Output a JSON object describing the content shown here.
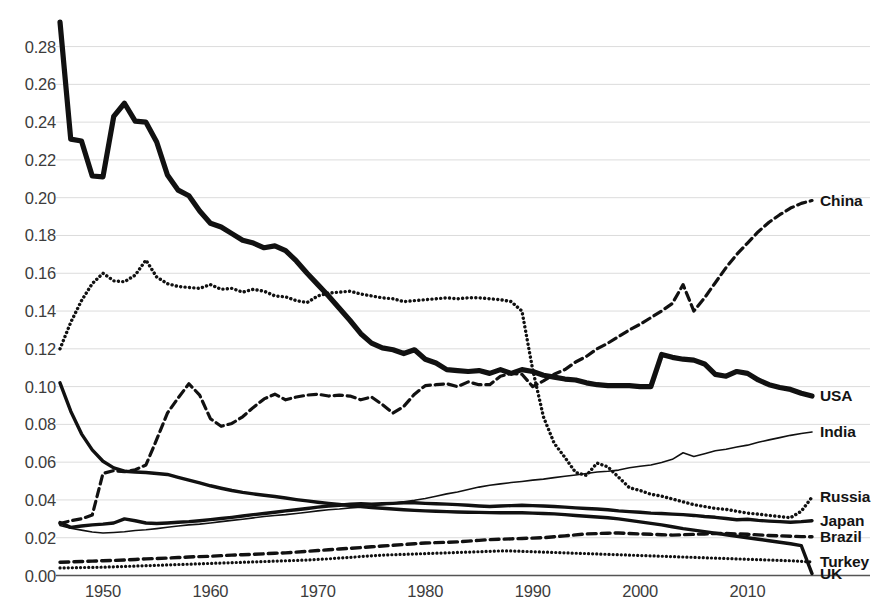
{
  "chart_data": {
    "type": "line",
    "title": "",
    "xlabel": "",
    "ylabel": "",
    "xlim": [
      1946,
      2016
    ],
    "ylim": [
      0.0,
      0.295
    ],
    "grid": true,
    "legend_position": "right-inline-labels",
    "y_ticks": [
      "0.00",
      "0.02",
      "0.04",
      "0.06",
      "0.08",
      "0.10",
      "0.12",
      "0.14",
      "0.16",
      "0.18",
      "0.20",
      "0.22",
      "0.24",
      "0.26",
      "0.28"
    ],
    "y_tick_values": [
      0.0,
      0.02,
      0.04,
      0.06,
      0.08,
      0.1,
      0.12,
      0.14,
      0.16,
      0.18,
      0.2,
      0.22,
      0.24,
      0.26,
      0.28
    ],
    "x_ticks": [
      "1950",
      "1960",
      "1970",
      "1980",
      "1990",
      "2000",
      "2010"
    ],
    "x_tick_values": [
      1950,
      1960,
      1970,
      1980,
      1990,
      2000,
      2010
    ],
    "x": [
      1946,
      1947,
      1948,
      1949,
      1950,
      1951,
      1952,
      1953,
      1954,
      1955,
      1956,
      1957,
      1958,
      1959,
      1960,
      1961,
      1962,
      1963,
      1964,
      1965,
      1966,
      1967,
      1968,
      1969,
      1970,
      1971,
      1972,
      1973,
      1974,
      1975,
      1976,
      1977,
      1978,
      1979,
      1980,
      1981,
      1982,
      1983,
      1984,
      1985,
      1986,
      1987,
      1988,
      1989,
      1990,
      1991,
      1992,
      1993,
      1994,
      1995,
      1996,
      1997,
      1998,
      1999,
      2000,
      2001,
      2002,
      2003,
      2004,
      2005,
      2006,
      2007,
      2008,
      2009,
      2010,
      2011,
      2012,
      2013,
      2014,
      2015,
      2016
    ],
    "series": [
      {
        "name": "China",
        "style": "dashed",
        "width": 3.2,
        "label_y": 0.1985,
        "values": [
          0.0275,
          0.029,
          0.03,
          0.032,
          0.054,
          0.0555,
          0.055,
          0.056,
          0.0585,
          0.072,
          0.086,
          0.094,
          0.1015,
          0.0955,
          0.083,
          0.079,
          0.0805,
          0.084,
          0.089,
          0.0935,
          0.096,
          0.093,
          0.0945,
          0.0955,
          0.096,
          0.095,
          0.0955,
          0.095,
          0.093,
          0.0945,
          0.0905,
          0.086,
          0.0895,
          0.096,
          0.1005,
          0.101,
          0.1015,
          0.1,
          0.1025,
          0.101,
          0.101,
          0.1055,
          0.107,
          0.1065,
          0.1,
          0.103,
          0.1065,
          0.109,
          0.113,
          0.116,
          0.12,
          0.123,
          0.1265,
          0.13,
          0.133,
          0.1365,
          0.14,
          0.144,
          0.154,
          0.14,
          0.147,
          0.155,
          0.163,
          0.17,
          0.176,
          0.182,
          0.187,
          0.191,
          0.1945,
          0.197,
          0.1985
        ]
      },
      {
        "name": "USA",
        "style": "solid",
        "width": 5.2,
        "label_y": 0.095,
        "values": [
          0.293,
          0.231,
          0.23,
          0.2115,
          0.211,
          0.243,
          0.25,
          0.2405,
          0.24,
          0.2295,
          0.212,
          0.204,
          0.201,
          0.193,
          0.1865,
          0.1845,
          0.181,
          0.1775,
          0.176,
          0.1735,
          0.1745,
          0.172,
          0.1665,
          0.16,
          0.154,
          0.148,
          0.1415,
          0.135,
          0.128,
          0.123,
          0.1205,
          0.1195,
          0.1175,
          0.1195,
          0.1145,
          0.1125,
          0.109,
          0.1085,
          0.108,
          0.1085,
          0.107,
          0.109,
          0.107,
          0.109,
          0.108,
          0.106,
          0.105,
          0.104,
          0.1035,
          0.102,
          0.101,
          0.1005,
          0.1005,
          0.1005,
          0.1,
          0.1,
          0.117,
          0.1155,
          0.1145,
          0.114,
          0.112,
          0.1065,
          0.1055,
          0.108,
          0.107,
          0.1035,
          0.101,
          0.0995,
          0.0985,
          0.0965,
          0.095
        ]
      },
      {
        "name": "India",
        "style": "solid",
        "width": 1.6,
        "label_y": 0.076,
        "values": [
          0.0265,
          0.025,
          0.024,
          0.023,
          0.0225,
          0.0228,
          0.0232,
          0.0238,
          0.0242,
          0.0248,
          0.0255,
          0.0262,
          0.0268,
          0.0272,
          0.0278,
          0.0285,
          0.0292,
          0.0298,
          0.0305,
          0.0312,
          0.0318,
          0.0322,
          0.0328,
          0.0335,
          0.0342,
          0.0348,
          0.0352,
          0.0358,
          0.0362,
          0.0368,
          0.0375,
          0.0382,
          0.039,
          0.0398,
          0.0408,
          0.042,
          0.0432,
          0.0442,
          0.0455,
          0.0468,
          0.0478,
          0.0485,
          0.0492,
          0.0498,
          0.0505,
          0.051,
          0.0518,
          0.0525,
          0.0532,
          0.054,
          0.0548,
          0.0552,
          0.0558,
          0.057,
          0.0578,
          0.0585,
          0.0598,
          0.0615,
          0.065,
          0.063,
          0.0645,
          0.066,
          0.0668,
          0.068,
          0.069,
          0.0705,
          0.0718,
          0.073,
          0.0742,
          0.0752,
          0.076
        ]
      },
      {
        "name": "Russia",
        "style": "dotted",
        "width": 3.4,
        "label_y": 0.0415,
        "values": [
          0.12,
          0.134,
          0.1455,
          0.1545,
          0.16,
          0.156,
          0.1555,
          0.159,
          0.167,
          0.158,
          0.1545,
          0.153,
          0.1525,
          0.152,
          0.154,
          0.1515,
          0.152,
          0.15,
          0.1515,
          0.1505,
          0.148,
          0.1475,
          0.1455,
          0.1445,
          0.148,
          0.1495,
          0.15,
          0.1505,
          0.149,
          0.148,
          0.147,
          0.1465,
          0.145,
          0.1455,
          0.146,
          0.1465,
          0.147,
          0.1465,
          0.147,
          0.147,
          0.1465,
          0.146,
          0.145,
          0.14,
          0.109,
          0.084,
          0.07,
          0.0625,
          0.0545,
          0.053,
          0.0595,
          0.0575,
          0.052,
          0.0465,
          0.045,
          0.043,
          0.042,
          0.0405,
          0.039,
          0.0375,
          0.0365,
          0.0355,
          0.035,
          0.034,
          0.033,
          0.0325,
          0.0318,
          0.0312,
          0.0306,
          0.034,
          0.0415
        ]
      },
      {
        "name": "Japan",
        "style": "solid",
        "width": 3.4,
        "label_y": 0.029,
        "values": [
          0.028,
          0.0255,
          0.0262,
          0.0268,
          0.0272,
          0.0278,
          0.03,
          0.029,
          0.0278,
          0.0275,
          0.0278,
          0.0282,
          0.0285,
          0.029,
          0.0296,
          0.0302,
          0.0308,
          0.0315,
          0.0322,
          0.0328,
          0.0335,
          0.0342,
          0.0348,
          0.0355,
          0.0362,
          0.0368,
          0.0372,
          0.0378,
          0.038,
          0.0378,
          0.038,
          0.0382,
          0.0385,
          0.0385,
          0.0382,
          0.038,
          0.0378,
          0.0375,
          0.0372,
          0.0368,
          0.0365,
          0.0368,
          0.037,
          0.0372,
          0.037,
          0.0368,
          0.0365,
          0.0362,
          0.0358,
          0.0355,
          0.0352,
          0.0348,
          0.0342,
          0.0338,
          0.0335,
          0.033,
          0.0328,
          0.0325,
          0.0322,
          0.0318,
          0.0312,
          0.0308,
          0.0302,
          0.0295,
          0.0298,
          0.0292,
          0.0288,
          0.0285,
          0.0282,
          0.0285,
          0.029
        ]
      },
      {
        "name": "Brazil",
        "style": "dashed",
        "width": 3.4,
        "label_y": 0.0205,
        "values": [
          0.007,
          0.0072,
          0.0074,
          0.0076,
          0.0078,
          0.008,
          0.0082,
          0.0085,
          0.0088,
          0.009,
          0.0092,
          0.0095,
          0.0098,
          0.01,
          0.0102,
          0.0105,
          0.0108,
          0.011,
          0.0112,
          0.0115,
          0.0118,
          0.012,
          0.0124,
          0.0128,
          0.0132,
          0.0136,
          0.014,
          0.0144,
          0.0148,
          0.0152,
          0.0156,
          0.016,
          0.0164,
          0.0168,
          0.0172,
          0.0174,
          0.0176,
          0.0178,
          0.0182,
          0.0186,
          0.019,
          0.0192,
          0.0194,
          0.0196,
          0.0198,
          0.02,
          0.0205,
          0.021,
          0.0215,
          0.022,
          0.0222,
          0.0224,
          0.0225,
          0.0222,
          0.022,
          0.0218,
          0.0216,
          0.0214,
          0.0216,
          0.0218,
          0.022,
          0.0222,
          0.0222,
          0.022,
          0.0218,
          0.0215,
          0.0212,
          0.021,
          0.0208,
          0.0206,
          0.0205
        ]
      },
      {
        "name": "Turkey",
        "style": "dotted",
        "width": 3.2,
        "label_y": 0.0072,
        "values": [
          0.004,
          0.0041,
          0.0042,
          0.0043,
          0.0044,
          0.0046,
          0.0048,
          0.005,
          0.0052,
          0.0054,
          0.0056,
          0.0058,
          0.006,
          0.0062,
          0.0064,
          0.0066,
          0.0068,
          0.007,
          0.0072,
          0.0074,
          0.0076,
          0.0078,
          0.008,
          0.0082,
          0.0085,
          0.0088,
          0.0092,
          0.0096,
          0.01,
          0.0104,
          0.0108,
          0.011,
          0.0112,
          0.0114,
          0.0116,
          0.0118,
          0.012,
          0.0122,
          0.0124,
          0.0126,
          0.0128,
          0.013,
          0.013,
          0.0128,
          0.0126,
          0.0124,
          0.0122,
          0.012,
          0.0118,
          0.0116,
          0.0114,
          0.0112,
          0.011,
          0.0108,
          0.0106,
          0.0104,
          0.0102,
          0.01,
          0.0098,
          0.0096,
          0.0094,
          0.0092,
          0.009,
          0.0088,
          0.0086,
          0.0084,
          0.0082,
          0.008,
          0.0078,
          0.0075,
          0.0072
        ]
      },
      {
        "name": "UK",
        "style": "solid",
        "width": 3.4,
        "label_y": 0.001,
        "values": [
          0.102,
          0.087,
          0.075,
          0.0665,
          0.0605,
          0.057,
          0.0552,
          0.0548,
          0.0545,
          0.054,
          0.0535,
          0.052,
          0.0505,
          0.049,
          0.0475,
          0.0462,
          0.045,
          0.044,
          0.0432,
          0.0425,
          0.0418,
          0.041,
          0.0402,
          0.0395,
          0.0388,
          0.0382,
          0.0376,
          0.037,
          0.0365,
          0.036,
          0.0356,
          0.0352,
          0.0348,
          0.0345,
          0.0342,
          0.034,
          0.0338,
          0.0336,
          0.0335,
          0.0334,
          0.0333,
          0.0332,
          0.0332,
          0.0332,
          0.033,
          0.0328,
          0.0326,
          0.0322,
          0.0318,
          0.0314,
          0.031,
          0.0306,
          0.03,
          0.0292,
          0.0284,
          0.0276,
          0.0268,
          0.0258,
          0.0248,
          0.024,
          0.0232,
          0.0224,
          0.0216,
          0.0208,
          0.02,
          0.0192,
          0.0184,
          0.0176,
          0.0168,
          0.0158,
          0.001
        ]
      }
    ]
  },
  "axis_color": "#3c3c3c",
  "grid_color": "#dcdcdc",
  "line_color": "#111111"
}
